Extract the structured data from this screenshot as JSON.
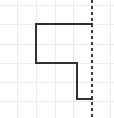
{
  "figure": {
    "canvas": {
      "width": 114,
      "height": 118,
      "background": "#ffffff"
    },
    "grid": {
      "color": "#eceaea",
      "stroke_width": 1,
      "spacing": 19,
      "vertical_x": [
        17,
        36,
        55,
        73,
        92,
        110
      ],
      "horizontal_y": [
        5,
        24,
        44,
        63,
        82,
        101
      ]
    },
    "shape": {
      "name": "step-polyline",
      "color": "#2f2f34",
      "stroke_width": 2,
      "fill": "none",
      "points": [
        [
          92,
          24
        ],
        [
          36,
          24
        ],
        [
          36,
          63
        ],
        [
          77,
          63
        ],
        [
          77,
          99
        ],
        [
          92,
          99
        ]
      ],
      "path": "M 92 24 L 36 24 L 36 63 L 77 63 L 77 99 L 92 99"
    },
    "symmetry_line": {
      "name": "vertical-line-of-symmetry",
      "color": "#3a3a3f",
      "stroke_width": 2,
      "dash_pattern": "3 3",
      "orientation": "vertical",
      "x": 92,
      "y_start": 0,
      "y_end": 118
    }
  }
}
